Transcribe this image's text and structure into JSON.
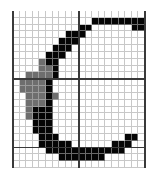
{
  "figure": {
    "label": "Pixel grid letter C",
    "glyph": "C",
    "cols": 20,
    "rows": 23,
    "colors": {
      "black": "#050505",
      "gray": "#6e6e6e",
      "empty": "#ffffff",
      "gridline": "#c8c8c8",
      "major_line": "#3a3a3a"
    },
    "major_lines": {
      "vertical_cols": [
        0,
        10,
        20
      ],
      "horizontal_rows": [
        10,
        20
      ]
    },
    "cells": [
      {
        "row": 1,
        "black": [
          12,
          13,
          14,
          15,
          16,
          17,
          18,
          19
        ],
        "gray": []
      },
      {
        "row": 2,
        "black": [
          10,
          11,
          18,
          19
        ],
        "gray": []
      },
      {
        "row": 3,
        "black": [
          8,
          9,
          10
        ],
        "gray": []
      },
      {
        "row": 4,
        "black": [
          7,
          8,
          9
        ],
        "gray": []
      },
      {
        "row": 5,
        "black": [
          6,
          7,
          8
        ],
        "gray": []
      },
      {
        "row": 6,
        "black": [
          5,
          6,
          7
        ],
        "gray": []
      },
      {
        "row": 7,
        "black": [
          5,
          6
        ],
        "gray": [
          4
        ]
      },
      {
        "row": 8,
        "black": [
          6
        ],
        "gray": [
          4,
          5
        ]
      },
      {
        "row": 9,
        "black": [
          6
        ],
        "gray": [
          2,
          3,
          4,
          5
        ]
      },
      {
        "row": 10,
        "black": [
          5
        ],
        "gray": [
          1,
          2,
          3,
          4
        ]
      },
      {
        "row": 11,
        "black": [
          5
        ],
        "gray": [
          1,
          2,
          3,
          4
        ]
      },
      {
        "row": 12,
        "black": [
          5
        ],
        "gray": [
          2,
          3,
          4,
          6
        ]
      },
      {
        "row": 13,
        "black": [
          5
        ],
        "gray": [
          2,
          3,
          4
        ]
      },
      {
        "row": 14,
        "black": [
          3,
          4,
          5
        ],
        "gray": [
          2
        ]
      },
      {
        "row": 15,
        "black": [
          3,
          4,
          5
        ],
        "gray": [
          2
        ]
      },
      {
        "row": 16,
        "black": [
          3,
          4,
          5
        ],
        "gray": []
      },
      {
        "row": 17,
        "black": [
          3,
          4,
          5
        ],
        "gray": []
      },
      {
        "row": 18,
        "black": [
          4,
          5,
          6,
          17,
          18
        ],
        "gray": []
      },
      {
        "row": 19,
        "black": [
          4,
          5,
          6,
          7,
          8,
          15,
          16,
          17
        ],
        "gray": []
      },
      {
        "row": 20,
        "black": [
          5,
          6,
          7,
          8,
          9,
          10,
          11,
          12,
          13,
          14,
          15,
          16
        ],
        "gray": []
      },
      {
        "row": 21,
        "black": [
          7,
          8,
          9,
          10,
          11,
          12,
          13
        ],
        "gray": []
      }
    ]
  }
}
